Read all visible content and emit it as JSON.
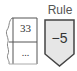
{
  "table": {
    "rows": [
      "33",
      "..."
    ]
  },
  "rule": {
    "label": "Rule",
    "value": "−5"
  },
  "colors": {
    "stroke": "#555555",
    "rule_fill": "#e6e6e6",
    "text": "#333333"
  }
}
